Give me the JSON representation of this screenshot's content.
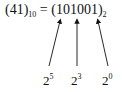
{
  "equation": {
    "lhs_value": "41",
    "lhs_base": "10",
    "equals": "=",
    "rhs_value": "101001",
    "rhs_base": "2"
  },
  "powers": [
    {
      "base": "2",
      "exponent": "5",
      "points_to_bit_index": 0
    },
    {
      "base": "2",
      "exponent": "3",
      "points_to_bit_index": 2
    },
    {
      "base": "2",
      "exponent": "0",
      "points_to_bit_index": 5
    }
  ]
}
